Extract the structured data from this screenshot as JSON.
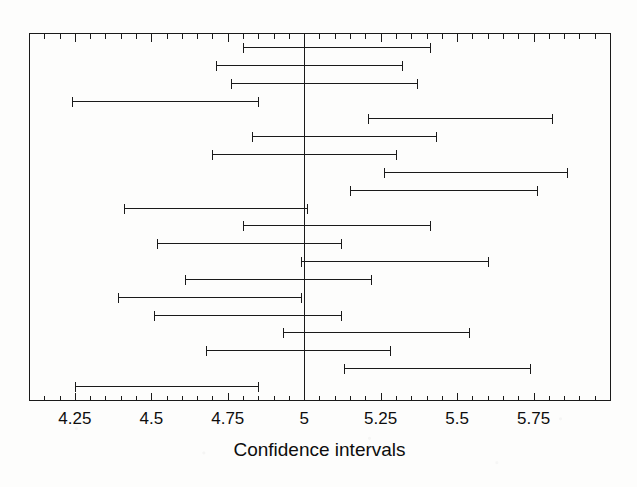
{
  "figure": {
    "width": 637,
    "height": 487,
    "background_color": "#fdfdfc",
    "ink_color": "#1a1a1a"
  },
  "plot_area": {
    "left_px": 29,
    "right_px": 610,
    "top_px": 33,
    "bottom_px": 400,
    "border": "full-box",
    "border_color": "#1a1a1a"
  },
  "axis": {
    "title": "Confidence intervals",
    "tick_labels": [
      "4.25",
      "4.5",
      "4.75",
      "5",
      "5.25",
      "5.5",
      "5.75"
    ],
    "tick_values": [
      4.25,
      4.5,
      4.75,
      5,
      5.25,
      5.5,
      5.75
    ],
    "minor_tick_step": 0.05,
    "x_min": 4.1,
    "x_max": 6.0,
    "ticks_inside": true,
    "ticks_on_top_edge": true,
    "ticks_on_bottom_edge": true
  },
  "reference_line": {
    "value": 5,
    "label": "5",
    "color": "#1a1a1a",
    "width_px": 1
  },
  "chart_data": {
    "type": "errorbar",
    "title": "",
    "subtitle": "",
    "xlabel": "Confidence intervals",
    "ylabel": "",
    "xlim": [
      4.1,
      6.0
    ],
    "ylim": [
      0,
      21
    ],
    "grid": false,
    "legend": "none",
    "orientation": "horizontal",
    "reference_line_x": 5,
    "n_intervals": 20,
    "series": [
      {
        "name": "Confidence intervals",
        "cap_style": "serif-end-caps",
        "intervals": [
          {
            "index": 1,
            "lower": 4.8,
            "upper": 5.41,
            "center": 5.105,
            "width": 0.61,
            "covers_5": true
          },
          {
            "index": 2,
            "lower": 4.71,
            "upper": 5.32,
            "center": 5.015,
            "width": 0.61,
            "covers_5": true
          },
          {
            "index": 3,
            "lower": 4.76,
            "upper": 5.37,
            "center": 5.065,
            "width": 0.61,
            "covers_5": true
          },
          {
            "index": 4,
            "lower": 4.24,
            "upper": 4.85,
            "center": 4.545,
            "width": 0.61,
            "covers_5": false
          },
          {
            "index": 5,
            "lower": 5.21,
            "upper": 5.81,
            "center": 5.51,
            "width": 0.6,
            "covers_5": false
          },
          {
            "index": 6,
            "lower": 4.83,
            "upper": 5.43,
            "center": 5.13,
            "width": 0.6,
            "covers_5": true
          },
          {
            "index": 7,
            "lower": 4.7,
            "upper": 5.3,
            "center": 5.0,
            "width": 0.6,
            "covers_5": true
          },
          {
            "index": 8,
            "lower": 5.26,
            "upper": 5.86,
            "center": 5.56,
            "width": 0.6,
            "covers_5": false
          },
          {
            "index": 9,
            "lower": 5.15,
            "upper": 5.76,
            "center": 5.455,
            "width": 0.61,
            "covers_5": false
          },
          {
            "index": 10,
            "lower": 4.41,
            "upper": 5.01,
            "center": 4.71,
            "width": 0.6,
            "covers_5": true
          },
          {
            "index": 11,
            "lower": 4.8,
            "upper": 5.41,
            "center": 5.105,
            "width": 0.61,
            "covers_5": true
          },
          {
            "index": 12,
            "lower": 4.52,
            "upper": 5.12,
            "center": 4.82,
            "width": 0.6,
            "covers_5": true
          },
          {
            "index": 13,
            "lower": 4.99,
            "upper": 5.6,
            "center": 5.295,
            "width": 0.61,
            "covers_5": true
          },
          {
            "index": 14,
            "lower": 4.61,
            "upper": 5.22,
            "center": 4.915,
            "width": 0.61,
            "covers_5": true
          },
          {
            "index": 15,
            "lower": 4.39,
            "upper": 4.99,
            "center": 4.69,
            "width": 0.6,
            "covers_5": false
          },
          {
            "index": 16,
            "lower": 4.51,
            "upper": 5.12,
            "center": 4.815,
            "width": 0.61,
            "covers_5": true
          },
          {
            "index": 17,
            "lower": 4.93,
            "upper": 5.54,
            "center": 5.235,
            "width": 0.61,
            "covers_5": true
          },
          {
            "index": 18,
            "lower": 4.68,
            "upper": 5.28,
            "center": 4.98,
            "width": 0.6,
            "covers_5": true
          },
          {
            "index": 19,
            "lower": 5.13,
            "upper": 5.74,
            "center": 5.435,
            "width": 0.61,
            "covers_5": false
          },
          {
            "index": 20,
            "lower": 4.25,
            "upper": 4.85,
            "center": 4.55,
            "width": 0.6,
            "covers_5": false
          }
        ]
      }
    ]
  }
}
